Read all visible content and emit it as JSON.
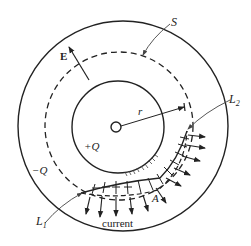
{
  "figure": {
    "labels": {
      "surface": "S",
      "field": "E",
      "radius": "r",
      "inner_charge": "+Q",
      "outer_charge": "−Q",
      "loop_upper": "L",
      "loop_upper_sub": "2",
      "loop_lower": "L",
      "loop_lower_sub": "1",
      "area": "A",
      "current": "current"
    },
    "colors": {
      "line": "#222222",
      "leader": "#555555",
      "background": "#ffffff"
    },
    "geometry": {
      "center": [
        120,
        127
      ],
      "outer_radius": 105,
      "dashed_radius": 74,
      "inner_radius": 46,
      "core_radius": 5
    }
  }
}
